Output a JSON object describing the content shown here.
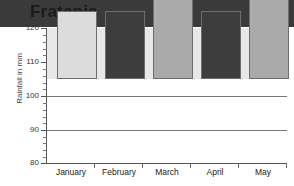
{
  "chart_data": {
    "type": "bar",
    "title": "Fratania",
    "xlabel": "",
    "ylabel": "Rainfall in mm",
    "categories": [
      "January",
      "February",
      "March",
      "April",
      "May"
    ],
    "values": [
      88,
      95,
      100,
      100,
      112
    ],
    "bar_colors": [
      "#3a3a3a",
      "#e8e8e8",
      "#dcdcdc",
      "#3d3d3d",
      "#aaaaaa"
    ],
    "ylim": [
      80,
      120
    ],
    "ytick_labels": [
      "80",
      "90",
      "100",
      "110",
      "120"
    ],
    "ytick_values": [
      80,
      90,
      100,
      110,
      120
    ],
    "yminor_step": 2,
    "gridlines_at": [
      90,
      100,
      110
    ],
    "grid": true,
    "legend": "none"
  }
}
